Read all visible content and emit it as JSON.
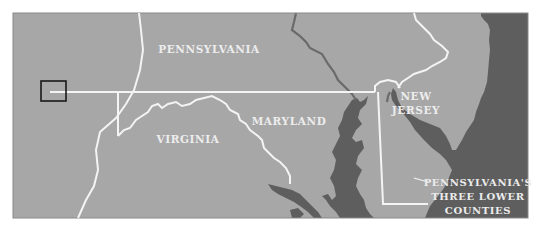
{
  "map": {
    "colors": {
      "land": "#a7a7a7",
      "water": "#5e5e5e",
      "border": "#f4f4f4",
      "river": "#6a6a6a",
      "frame": "#8a8a8a",
      "locator_box": "#1a1a1a",
      "label": "#ececec"
    },
    "labels": {
      "pennsylvania": "PENNSYLVANIA",
      "new_jersey_line1": "NEW",
      "new_jersey_line2": "JERSEY",
      "maryland": "MARYLAND",
      "virginia": "VIRGINIA",
      "lower_counties_line1": "PENNSYLVANIA'S",
      "lower_counties_line2": "THREE LOWER",
      "lower_counties_line3": "COUNTIES"
    }
  }
}
